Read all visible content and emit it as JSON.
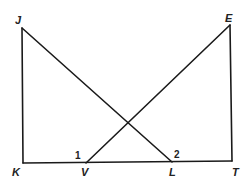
{
  "diagram": {
    "type": "geometry-figure",
    "points": {
      "J": {
        "label": "J"
      },
      "K": {
        "label": "K"
      },
      "V": {
        "label": "V"
      },
      "L": {
        "label": "L"
      },
      "T": {
        "label": "T"
      },
      "E": {
        "label": "E"
      }
    },
    "segments": [
      {
        "name": "JK",
        "from": "J",
        "to": "K"
      },
      {
        "name": "KT",
        "from": "K",
        "to": "T"
      },
      {
        "name": "ET",
        "from": "E",
        "to": "T"
      },
      {
        "name": "JL",
        "from": "J",
        "to": "L"
      },
      {
        "name": "EV",
        "from": "E",
        "to": "V"
      }
    ],
    "angle_labels": {
      "angle1": "1",
      "angle2": "2"
    }
  }
}
